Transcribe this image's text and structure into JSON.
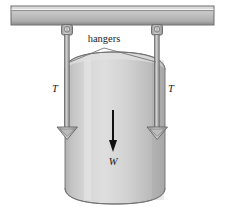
{
  "figure": {
    "type": "free-body-diagram",
    "background_color": "#ffffff"
  },
  "labels": {
    "hangers": "hangers",
    "tension_left": "T",
    "tension_right": "T",
    "weight": "W"
  },
  "colors": {
    "beam_light": "#d8d8d8",
    "beam_mid": "#b8b8b8",
    "beam_dark": "#8f8f8f",
    "beam_outline": "#5a5a5a",
    "cylinder_light": "#dcdcdc",
    "cylinder_mid": "#c4c4c4",
    "cylinder_shadow": "#a8a8a8",
    "cylinder_outline": "#6e6e6e",
    "hanger_rod": "#9a9a9a",
    "hanger_rod_outline": "#6a6a6a",
    "arrow": "#111111",
    "leader_line": "#707070",
    "text": "#1a1a1a"
  },
  "geometry": {
    "beam": {
      "x": 11,
      "y": 6,
      "width": 203,
      "height": 19
    },
    "cylinder": {
      "x": 65,
      "y": 55,
      "width": 100,
      "height": 148
    },
    "hanger_left_x": 67,
    "hanger_right_x": 157,
    "hanger_top_y": 25,
    "hanger_bottom_y": 134
  },
  "annotations": {
    "weight_arrow": {
      "from_y": 110,
      "to_y": 150,
      "x": 113,
      "direction": "down"
    },
    "leader_apex": {
      "x": 104,
      "y": 48
    }
  }
}
